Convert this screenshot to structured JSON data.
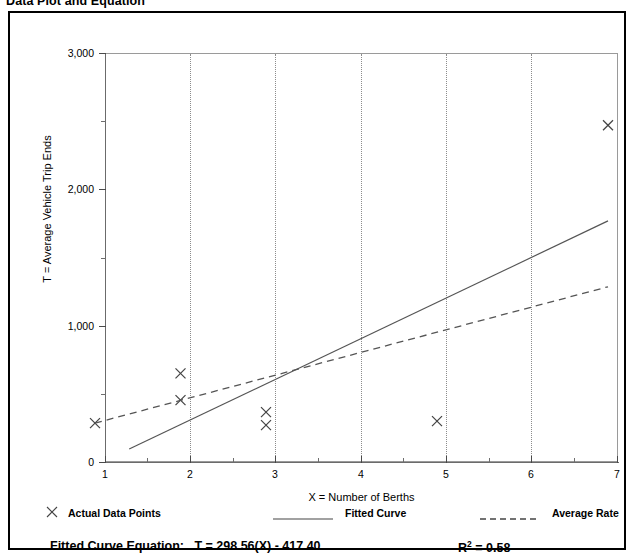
{
  "title": "Data Plot and Equation",
  "chart_data": {
    "type": "scatter",
    "title": "Data Plot and Equation",
    "xlabel": "X = Number of Berths",
    "ylabel": "T = Average Vehicle Trip Ends",
    "xlim": [
      1,
      7
    ],
    "ylim": [
      0,
      3000
    ],
    "grid": "vertical dotted gridlines at x = 2,3,4,5,6",
    "xticks": [
      "1",
      "2",
      "3",
      "4",
      "5",
      "6",
      "7"
    ],
    "yticks": [
      "0",
      "1,000",
      "2,000",
      "3,000"
    ],
    "y_minor_ticks": [
      500,
      1500,
      2500
    ],
    "legend_position": "below plot",
    "series": [
      {
        "name": "Actual Data Points",
        "type": "scatter",
        "marker": "x",
        "points": [
          {
            "x": 1,
            "y": 190
          },
          {
            "x": 2,
            "y": 555
          },
          {
            "x": 2,
            "y": 358
          },
          {
            "x": 3,
            "y": 270
          },
          {
            "x": 3,
            "y": 175
          },
          {
            "x": 5,
            "y": 205
          },
          {
            "x": 7,
            "y": 2375
          }
        ]
      },
      {
        "name": "Fitted Curve",
        "type": "line",
        "style": "solid",
        "equation": "T = 298.56(X) - 417.40",
        "endpoints": [
          {
            "x": 1.4,
            "y": 0
          },
          {
            "x": 7,
            "y": 1673
          }
        ]
      },
      {
        "name": "Average Rate",
        "type": "line",
        "style": "dashed",
        "endpoints": [
          {
            "x": 1,
            "y": 190
          },
          {
            "x": 7,
            "y": 1190
          }
        ]
      }
    ]
  },
  "legend": {
    "items": [
      {
        "label": "Actual Data Points",
        "marker": "x-marker"
      },
      {
        "label": "Fitted Curve",
        "marker": "solid-line"
      },
      {
        "label": "Average Rate",
        "marker": "dashed-line"
      }
    ]
  },
  "equation": {
    "label": "Fitted Curve Equation:",
    "value": "T = 298.56(X) - 417.40",
    "r2_label": "R",
    "r2_sup": "2",
    "r2_value": "= 0.58"
  },
  "colors": {
    "border": "#000000",
    "plot_line": "#555555",
    "grid": "#8c8c8c",
    "background": "#ffffff"
  }
}
